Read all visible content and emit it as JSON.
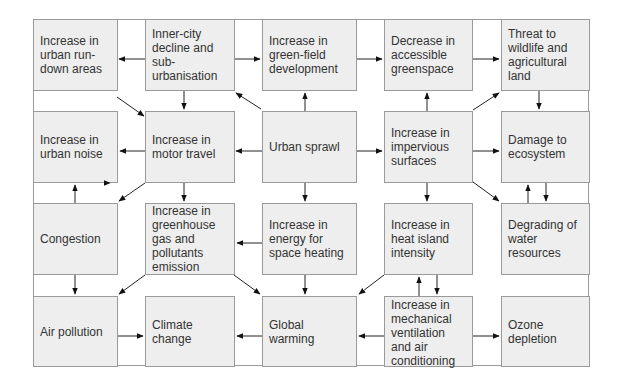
{
  "diagram": {
    "type": "flowchart",
    "nodes": {
      "n11": "Increase in\nurban run-\ndown areas",
      "n12": "Inner-city\ndecline and\nsub-\nurbanisation",
      "n13": "Increase in\ngreen-field\ndevelopment",
      "n14": "Decrease in\naccessible\ngreenspace",
      "n15": "Threat to\nwildlife and\nagricultural\nland",
      "n21": "Increase in\nurban noise",
      "n22": "Increase in\nmotor travel",
      "n23": "Urban sprawl",
      "n24": "Increase in\nimpervious\nsurfaces",
      "n25": "Damage to\necosystem",
      "n31": "Congestion",
      "n32": "Increase in\ngreenhouse\ngas and\npollutants\nemission",
      "n33": "Increase in\nenergy for\nspace heating",
      "n34": "Increase in\nheat island\nintensity",
      "n35": "Degrading of\nwater\nresources",
      "n41": "Air pollution",
      "n42": "Climate\nchange",
      "n43": "Global\nwarming",
      "n44": "Increase in\nmechanical\nventilation\nand air\nconditioning",
      "n45": "Ozone\ndepletion"
    },
    "edges": [
      [
        "n12",
        "n11"
      ],
      [
        "n12",
        "n13"
      ],
      [
        "n12",
        "n22"
      ],
      [
        "n11",
        "n22"
      ],
      [
        "n13",
        "n14"
      ],
      [
        "n14",
        "n15"
      ],
      [
        "n23",
        "n13"
      ],
      [
        "n23",
        "n12"
      ],
      [
        "n24",
        "n14"
      ],
      [
        "n24",
        "n15"
      ],
      [
        "n15",
        "n25"
      ],
      [
        "n23",
        "n22"
      ],
      [
        "n22",
        "n21"
      ],
      [
        "n23",
        "n24"
      ],
      [
        "n24",
        "n25"
      ],
      [
        "n22",
        "n31"
      ],
      [
        "n22",
        "n32"
      ],
      [
        "n23",
        "n33"
      ],
      [
        "n24",
        "n34"
      ],
      [
        "n24",
        "n35"
      ],
      [
        "n31",
        "n21"
      ],
      [
        "n25",
        "n35"
      ],
      [
        "n35",
        "n25"
      ],
      [
        "n33",
        "n32"
      ],
      [
        "n31",
        "n41"
      ],
      [
        "n32",
        "n41"
      ],
      [
        "n32",
        "n43"
      ],
      [
        "n33",
        "n43"
      ],
      [
        "n34",
        "n43"
      ],
      [
        "n34",
        "n44"
      ],
      [
        "n44",
        "n34"
      ],
      [
        "n41",
        "n42"
      ],
      [
        "n43",
        "n42"
      ],
      [
        "n44",
        "n43"
      ],
      [
        "n44",
        "n45"
      ]
    ],
    "colors": {
      "box_fill": "#eeeeee",
      "box_border": "#9a9a9a",
      "text": "#333333",
      "arrow": "#111111"
    }
  }
}
